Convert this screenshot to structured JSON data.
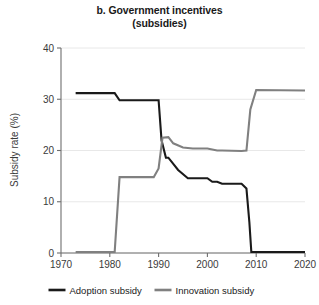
{
  "chart_data": {
    "type": "line",
    "title": "b. Government incentives",
    "subtitle": "(subsidies)",
    "title_lines": [
      "b. Government incentives",
      "(subsidies)"
    ],
    "xlabel": "",
    "ylabel": "Subsidy rate (%)",
    "xlim": [
      1970,
      2020
    ],
    "ylim": [
      0,
      40
    ],
    "xticks": [
      1970,
      1980,
      1990,
      2000,
      2010,
      2020
    ],
    "yticks": [
      0,
      10,
      20,
      30,
      40
    ],
    "xtick_labels": [
      "1970",
      "1980",
      "1990",
      "2000",
      "2010",
      "2020"
    ],
    "ytick_labels": [
      "0",
      "10",
      "20",
      "30",
      "40"
    ],
    "grid": "horizontal",
    "legend_position": "bottom",
    "colors": {
      "adoption": "#1a1a1a",
      "innovation": "#808080",
      "grid": "#e8e8e8",
      "axis": "#6e6e6e",
      "background": "#ffffff"
    },
    "series": [
      {
        "name": "Adoption subsidy",
        "color": "#1a1a1a",
        "x": [
          1973,
          1981,
          1982,
          1990,
          1990.6,
          1991.5,
          1992,
          1994,
          1996,
          1999,
          2000,
          2001,
          2002,
          2003,
          2007,
          2008,
          2008.6,
          2009,
          2020
        ],
        "values": [
          31.2,
          31.2,
          29.8,
          29.8,
          22.0,
          18.6,
          18.6,
          16.2,
          14.6,
          14.6,
          14.6,
          13.9,
          13.9,
          13.5,
          13.5,
          12.6,
          6.0,
          0.2,
          0.2
        ]
      },
      {
        "name": "Innovation subsidy",
        "color": "#808080",
        "x": [
          1973,
          1981,
          1982,
          1989,
          1990,
          1990.8,
          1992,
          1993,
          1995,
          1997,
          2000,
          2002,
          2003,
          2007,
          2008,
          2008.8,
          2010,
          2020
        ],
        "values": [
          0.2,
          0.2,
          14.8,
          14.8,
          16.5,
          22.5,
          22.6,
          21.4,
          20.6,
          20.4,
          20.4,
          20.0,
          20.0,
          19.9,
          20.0,
          28.0,
          31.8,
          31.7
        ]
      }
    ],
    "legend": [
      {
        "label": "Adoption subsidy",
        "color": "#1a1a1a"
      },
      {
        "label": "Innovation subsidy",
        "color": "#808080"
      }
    ]
  }
}
